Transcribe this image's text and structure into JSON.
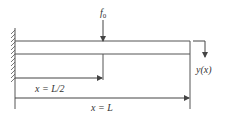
{
  "diagram": {
    "load_label": "f",
    "load_subscript": "0",
    "deflection_label": "y(x)",
    "midpoint_label": "x = L/2",
    "end_label": "x = L",
    "colors": {
      "line": "#444444",
      "text": "#333333",
      "background": "#ffffff"
    }
  }
}
